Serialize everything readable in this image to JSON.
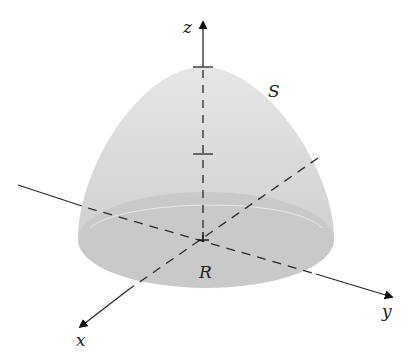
{
  "diagram": {
    "labels": {
      "z_axis": "z",
      "x_axis": "x",
      "y_axis": "y",
      "surface": "S",
      "region": "R"
    },
    "colors": {
      "surface_fill": "#d6d6d6",
      "base_fill": "#c8c8c8",
      "axis": "#2a2a2a",
      "background": "#ffffff"
    }
  }
}
